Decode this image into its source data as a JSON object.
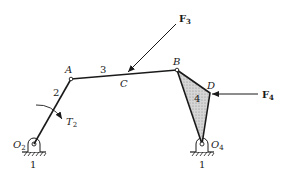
{
  "diagram": {
    "points": {
      "O2": {
        "label": "O",
        "sub": "2",
        "x": 34,
        "y": 144
      },
      "A": {
        "label": "A",
        "x": 71,
        "y": 79
      },
      "C": {
        "label": "C",
        "x": 127,
        "y": 74
      },
      "B": {
        "label": "B",
        "x": 177,
        "y": 70
      },
      "D": {
        "label": "D",
        "x": 210,
        "y": 93
      },
      "O4": {
        "label": "O",
        "sub": "4",
        "x": 202,
        "y": 144
      }
    },
    "links": {
      "link2": {
        "label": "2"
      },
      "link3": {
        "label": "3"
      },
      "link4": {
        "label": "4"
      },
      "ground_left": {
        "label": "1"
      },
      "ground_right": {
        "label": "1"
      }
    },
    "forces": {
      "F3": {
        "label": "F",
        "sub": "3"
      },
      "F4": {
        "label": "F",
        "sub": "4"
      }
    },
    "torques": {
      "T2": {
        "label": "T",
        "sub": "2"
      }
    },
    "colors": {
      "line": "#1a1a1a",
      "fill_link4": "#c8c8c8",
      "background": "#ffffff"
    }
  }
}
